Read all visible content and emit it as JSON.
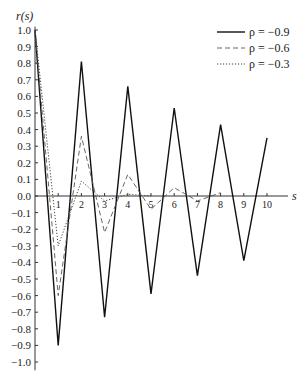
{
  "chart_data": {
    "type": "line",
    "title": "",
    "xlabel": "s",
    "ylabel": "r(s)",
    "xlim": [
      0,
      11
    ],
    "ylim": [
      -1.0,
      1.0
    ],
    "grid": false,
    "legend_position": "top-right",
    "x_ticks": [
      1,
      2,
      3,
      4,
      5,
      6,
      7,
      8,
      9,
      10
    ],
    "y_ticks": [
      1.0,
      0.9,
      0.8,
      0.7,
      0.6,
      0.5,
      0.4,
      0.3,
      0.2,
      0.1,
      0.0,
      -0.1,
      -0.2,
      -0.3,
      -0.4,
      -0.5,
      -0.6,
      -0.7,
      -0.8,
      -0.9,
      -1.0
    ],
    "y_tick_labels": [
      "1.0",
      "0.9",
      "0.8",
      "0.7",
      "0.6",
      "0.5",
      "0.4",
      "0.3",
      "0.2",
      "0.1",
      "0.0",
      "−0.1",
      "−0.2",
      "−0.3",
      "−0.4",
      "−0.5",
      "−0.6",
      "−0.7",
      "−0.8",
      "−0.9",
      "−1.0"
    ],
    "series": [
      {
        "name": "ρ = −0.9",
        "style": "solid",
        "x": [
          0,
          1,
          2,
          3,
          4,
          5,
          6,
          7,
          8,
          9,
          10
        ],
        "values": [
          1.0,
          -0.9,
          0.81,
          -0.73,
          0.66,
          -0.59,
          0.53,
          -0.48,
          0.43,
          -0.39,
          0.35
        ]
      },
      {
        "name": "ρ = −0.6",
        "style": "dashed",
        "x": [
          0,
          1,
          2,
          3,
          4,
          5,
          6,
          7,
          8
        ],
        "values": [
          1.0,
          -0.6,
          0.36,
          -0.22,
          0.13,
          -0.08,
          0.05,
          -0.03,
          0.02
        ]
      },
      {
        "name": "ρ = −0.3",
        "style": "dotted",
        "x": [
          0,
          1,
          2,
          3,
          4,
          5
        ],
        "values": [
          1.0,
          -0.3,
          0.09,
          -0.03,
          0.01,
          0.0
        ]
      }
    ]
  },
  "legend": {
    "items": [
      {
        "label": "ρ = −0.9",
        "style": "solid"
      },
      {
        "label": "ρ = −0.6",
        "style": "dashed"
      },
      {
        "label": "ρ = −0.3",
        "style": "dotted"
      }
    ]
  },
  "axes": {
    "ylabel": "r(s)",
    "xlabel": "s"
  }
}
